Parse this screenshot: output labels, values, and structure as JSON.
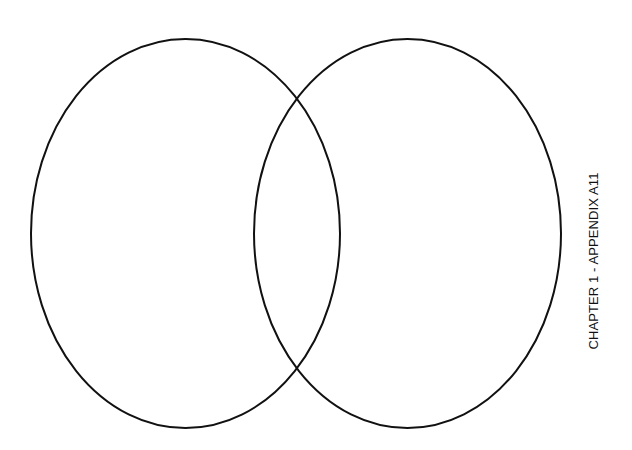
{
  "diagram": {
    "type": "venn",
    "sets": [
      {
        "id": "left",
        "label": ""
      },
      {
        "id": "right",
        "label": ""
      }
    ],
    "stroke_color": "#111111",
    "background_color": "#ffffff"
  },
  "side_label": "CHAPTER 1 - APPENDIX A11"
}
